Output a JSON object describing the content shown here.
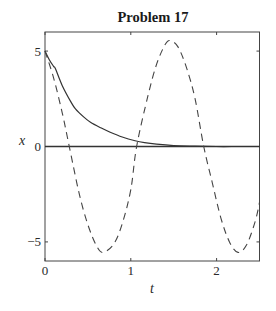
{
  "chart_data": {
    "type": "line",
    "title": "Problem 17",
    "xlabel": "t",
    "ylabel": "x",
    "xlim": [
      0,
      2.5
    ],
    "ylim": [
      -6,
      6
    ],
    "xticks": [
      0,
      1,
      2
    ],
    "xtick_labels": [
      "0",
      "1",
      "2"
    ],
    "yticks": [
      -5,
      0,
      5
    ],
    "ytick_labels": [
      "−5",
      "0",
      "5"
    ],
    "grid": false,
    "legend": null,
    "reference_lines": [
      {
        "type": "horizontal",
        "y": 0,
        "style": "solid"
      }
    ],
    "series": [
      {
        "name": "solid (damped)",
        "style": "solid",
        "x": [
          0,
          0.05,
          0.1,
          0.122,
          0.2,
          0.3,
          0.355,
          0.45,
          0.53,
          0.65,
          0.76,
          0.9,
          1.05,
          1.16,
          1.3,
          1.5,
          1.75,
          2.0,
          2.25,
          2.5
        ],
        "y": [
          5.0,
          4.55,
          4.2,
          4.07,
          3.2,
          2.35,
          1.97,
          1.55,
          1.27,
          0.98,
          0.75,
          0.5,
          0.3,
          0.2,
          0.12,
          0.05,
          0.02,
          0.0,
          0.0,
          0.0
        ]
      },
      {
        "name": "dashed (undamped)",
        "style": "dashed",
        "x": [
          0,
          0.1,
          0.2,
          0.283,
          0.4,
          0.5,
          0.6,
          0.675,
          0.8,
          0.9,
          1.0,
          1.068,
          1.2,
          1.3,
          1.4,
          1.46,
          1.55,
          1.65,
          1.75,
          1.85,
          1.95,
          2.05,
          2.15,
          2.25,
          2.35,
          2.45,
          2.5
        ],
        "y": [
          5.0,
          3.6,
          1.78,
          0.0,
          -2.5,
          -4.1,
          -5.2,
          -5.55,
          -5.12,
          -4.05,
          -2.26,
          0.0,
          2.66,
          4.3,
          5.34,
          5.55,
          5.22,
          4.12,
          2.48,
          0.0,
          -1.9,
          -3.75,
          -5.0,
          -5.55,
          -5.15,
          -3.92,
          -2.93
        ]
      }
    ]
  }
}
